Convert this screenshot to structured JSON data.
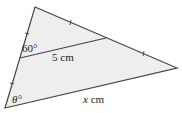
{
  "diagram": {
    "type": "triangle-midsegment",
    "vertices": {
      "top": [
        35,
        7
      ],
      "right": [
        177,
        68
      ],
      "bottom_left": [
        5,
        108
      ]
    },
    "midpoints": {
      "left_side": [
        20,
        58
      ],
      "right_side": [
        106,
        38
      ]
    },
    "labels": {
      "angle_top": "60°",
      "midsegment": "5 cm",
      "angle_bottom": "θ°",
      "base": "x cm"
    },
    "colors": {
      "fill": "#eeeeee",
      "stroke": "#444444"
    }
  }
}
